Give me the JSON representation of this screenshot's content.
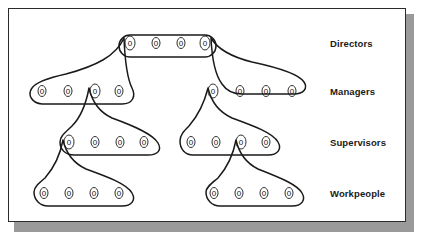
{
  "figure": {
    "node_glyph": "0",
    "line_color": "#1a1a1a",
    "card_background": "#ffffff",
    "shadow_color": "#9a9a9a",
    "border_color": "#2b2b2b"
  },
  "labels": {
    "directors": "Directors",
    "managers": "Managers",
    "supervisors": "Supervisors",
    "workpeople": "Workpeople"
  },
  "levels": [
    {
      "id": "directors",
      "label": "Directors",
      "groups": [
        {
          "id": "directors-group",
          "nodes": [
            "0",
            "0",
            "0",
            "0"
          ]
        }
      ]
    },
    {
      "id": "managers",
      "label": "Managers",
      "groups": [
        {
          "id": "managers-left-group",
          "nodes": [
            "0",
            "0",
            "0",
            "0"
          ]
        },
        {
          "id": "managers-right-group",
          "nodes": [
            "0",
            "0",
            "0",
            "0"
          ]
        }
      ]
    },
    {
      "id": "supervisors",
      "label": "Supervisors",
      "groups": [
        {
          "id": "supervisors-left-group",
          "nodes": [
            "0",
            "0",
            "0",
            "0"
          ]
        },
        {
          "id": "supervisors-right-group",
          "nodes": [
            "0",
            "0",
            "0",
            "0"
          ]
        }
      ]
    },
    {
      "id": "workpeople",
      "label": "Workpeople",
      "groups": [
        {
          "id": "workpeople-left-group",
          "nodes": [
            "0",
            "0",
            "0",
            "0"
          ]
        },
        {
          "id": "workpeople-right-group",
          "nodes": [
            "0",
            "0",
            "0",
            "0"
          ]
        }
      ]
    }
  ],
  "nodes": {
    "directors": [
      {
        "x": 130,
        "y": 46,
        "v": "0"
      },
      {
        "x": 156,
        "y": 46,
        "v": "0"
      },
      {
        "x": 181,
        "y": 46,
        "v": "0"
      },
      {
        "x": 205,
        "y": 46,
        "v": "0"
      }
    ],
    "managers_left": [
      {
        "x": 42,
        "y": 94,
        "v": "0"
      },
      {
        "x": 68,
        "y": 94,
        "v": "0"
      },
      {
        "x": 95,
        "y": 94,
        "v": "0"
      },
      {
        "x": 119,
        "y": 94,
        "v": "0"
      }
    ],
    "managers_right": [
      {
        "x": 213,
        "y": 94,
        "v": "0"
      },
      {
        "x": 240,
        "y": 94,
        "v": "0"
      },
      {
        "x": 266,
        "y": 94,
        "v": "0"
      },
      {
        "x": 292,
        "y": 94,
        "v": "0"
      }
    ],
    "supervisors_left": [
      {
        "x": 69,
        "y": 145,
        "v": "0"
      },
      {
        "x": 95,
        "y": 145,
        "v": "0"
      },
      {
        "x": 120,
        "y": 145,
        "v": "0"
      },
      {
        "x": 144,
        "y": 145,
        "v": "0"
      }
    ],
    "supervisors_right": [
      {
        "x": 191,
        "y": 145,
        "v": "0"
      },
      {
        "x": 216,
        "y": 145,
        "v": "0"
      },
      {
        "x": 241,
        "y": 145,
        "v": "0"
      },
      {
        "x": 266,
        "y": 145,
        "v": "0"
      }
    ],
    "workpeople_left": [
      {
        "x": 44,
        "y": 196,
        "v": "0"
      },
      {
        "x": 69,
        "y": 196,
        "v": "0"
      },
      {
        "x": 94,
        "y": 196,
        "v": "0"
      },
      {
        "x": 119,
        "y": 196,
        "v": "0"
      }
    ],
    "workpeople_right": [
      {
        "x": 214,
        "y": 196,
        "v": "0"
      },
      {
        "x": 239,
        "y": 196,
        "v": "0"
      },
      {
        "x": 264,
        "y": 196,
        "v": "0"
      },
      {
        "x": 289,
        "y": 196,
        "v": "0"
      }
    ]
  }
}
